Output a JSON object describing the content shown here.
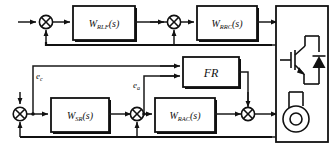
{
  "diagram": {
    "blocks": [
      {
        "id": "w_rlf",
        "main": "W",
        "sub": "RLF",
        "tail": "(s)"
      },
      {
        "id": "w_rrc",
        "main": "W",
        "sub": "RRC",
        "tail": "(s)"
      },
      {
        "id": "w_sr",
        "main": "W",
        "sub": "SR",
        "tail": "(s)"
      },
      {
        "id": "w_rac",
        "main": "W",
        "sub": "RAC",
        "tail": "(s)"
      },
      {
        "id": "fr",
        "main": "FR",
        "sub": "",
        "tail": ""
      }
    ],
    "signals": [
      {
        "id": "e_c",
        "main": "e",
        "sub": "c"
      },
      {
        "id": "e_a",
        "main": "e",
        "sub": "a"
      }
    ],
    "summing_junctions": [
      {
        "id": "sum-top-left"
      },
      {
        "id": "sum-top-right"
      },
      {
        "id": "sum-bottom-left"
      },
      {
        "id": "sum-bottom-mid"
      },
      {
        "id": "sum-bottom-right"
      }
    ],
    "plant": {
      "id": "power-stage",
      "components": [
        "igbt-transistor",
        "freewheel-diode",
        "motor"
      ]
    },
    "colors": {
      "line": "#1a1a1a",
      "fill": "#ffffff",
      "text": "#111111"
    }
  }
}
